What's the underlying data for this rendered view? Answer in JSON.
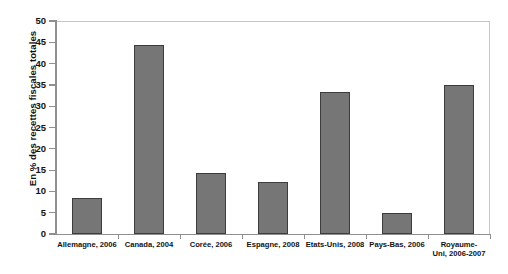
{
  "chart_data": {
    "type": "bar",
    "title": "",
    "xlabel": "",
    "ylabel": "En % des recettes fiscales totales",
    "ylim": [
      0,
      50
    ],
    "ytick_step": 5,
    "yticks": [
      "0",
      "5",
      "10",
      "15",
      "20",
      "25",
      "30",
      "35",
      "40",
      "45",
      "50"
    ],
    "grid": false,
    "legend": null,
    "bar_color": "#767676",
    "bar_border_color": "#3d3d3d",
    "axis_color": "#8f8f8f",
    "categories": [
      "Allemagne, 2006",
      "Canada, 2004",
      "Corée, 2006",
      "Espagne, 2008",
      "Etats-Unis, 2008",
      "Pays-Bas, 2006",
      "Royaume-\nUni, 2006-2007"
    ],
    "category_labels_display": [
      "Allemagne, 2006",
      "Canada, 2004",
      "Corée, 2006",
      "Espagne, 2008",
      "Etats-Unis, 2008",
      "Pays-Bas, 2006",
      "Royaume-Uni, 2006-2007"
    ],
    "values": [
      8.5,
      44.3,
      14.4,
      12.3,
      33.4,
      4.9,
      34.9
    ]
  }
}
